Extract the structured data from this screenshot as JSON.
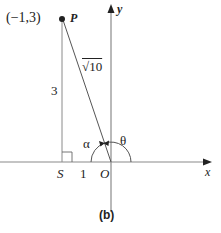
{
  "figure": {
    "caption": "(b)",
    "point": {
      "label": "P",
      "coords": "(−1,3)"
    },
    "axes": {
      "x_label": "x",
      "y_label": "y"
    },
    "labels": {
      "S": "S",
      "O": "O",
      "one": "1",
      "three": "3",
      "hypotenuse": "√10",
      "alpha": "α",
      "theta": "θ"
    },
    "colors": {
      "line": "#555555",
      "axis": "#777777",
      "text": "#222222",
      "point": "#222222"
    }
  }
}
